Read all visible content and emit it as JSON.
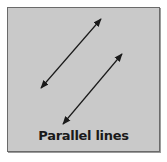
{
  "figure": {
    "caption": "Parallel lines",
    "background_color": "#c9c9c9",
    "border_color": "#6a6a6a",
    "line_color": "#1a1a1a"
  },
  "lines": [
    {
      "name": "line-1",
      "from": [
        41,
        88
      ],
      "to": [
        101,
        19
      ],
      "arrowheads": "both"
    },
    {
      "name": "line-2",
      "from": [
        63,
        124
      ],
      "to": [
        122,
        54
      ],
      "arrowheads": "both"
    }
  ]
}
